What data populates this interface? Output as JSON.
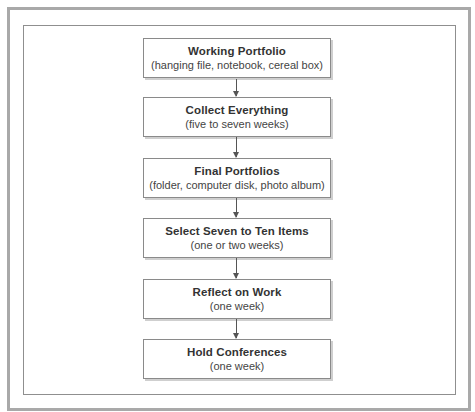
{
  "diagram": {
    "type": "flowchart",
    "direction": "top-to-bottom",
    "steps": [
      {
        "title": "Working Portfolio",
        "subtitle": "(hanging file, notebook, cereal box)"
      },
      {
        "title": "Collect Everything",
        "subtitle": "(five to seven weeks)"
      },
      {
        "title": "Final Portfolios",
        "subtitle": "(folder, computer disk, photo album)"
      },
      {
        "title": "Select Seven to Ten Items",
        "subtitle": "(one or two weeks)"
      },
      {
        "title": "Reflect on Work",
        "subtitle": "(one week)"
      },
      {
        "title": "Hold Conferences",
        "subtitle": "(one week)"
      }
    ],
    "connections": [
      {
        "from": 0,
        "to": 1
      },
      {
        "from": 1,
        "to": 2
      },
      {
        "from": 2,
        "to": 3
      },
      {
        "from": 3,
        "to": 4
      },
      {
        "from": 4,
        "to": 5
      }
    ],
    "colors": {
      "frame_outer": "#a9a9a9",
      "frame_inner": "#8f8f8f",
      "box_border": "#8a8a8a",
      "text": "#333333",
      "arrow": "#555555"
    }
  }
}
